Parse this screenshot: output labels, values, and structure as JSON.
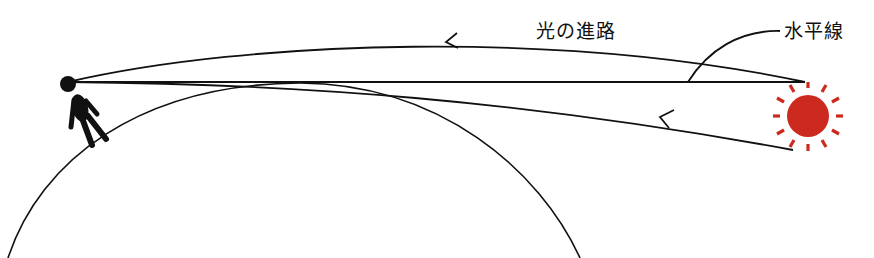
{
  "labels": {
    "light_path": "光の進路",
    "horizon": "水平線"
  },
  "colors": {
    "line": "#111111",
    "sun": "#CC2A1E",
    "background": "#ffffff"
  },
  "elements": {
    "observer": "person standing on the curved Earth surface",
    "earth": "large circular arc representing Earth",
    "sun": "red sun with rays positioned below the horizon",
    "horizon_line": "straight line from observer's eye to horizon point",
    "refracted_path": "curved upper light path with leftward arrow",
    "actual_path": "lower straight-ish light path from sun with leftward arrow"
  }
}
